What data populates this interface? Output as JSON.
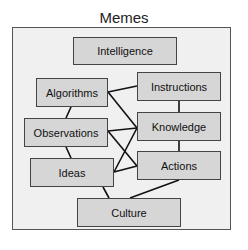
{
  "title": "Memes",
  "colors": {
    "frame_bg": "#f0f0f0",
    "node_bg": "#d6d6d6",
    "border": "#444444",
    "edge": "#111111"
  },
  "nodes": [
    {
      "id": "intelligence",
      "label": "Intelligence"
    },
    {
      "id": "algorithms",
      "label": "Algorithms"
    },
    {
      "id": "instructions",
      "label": "Instructions"
    },
    {
      "id": "observations",
      "label": "Observations"
    },
    {
      "id": "knowledge",
      "label": "Knowledge"
    },
    {
      "id": "ideas",
      "label": "Ideas"
    },
    {
      "id": "actions",
      "label": "Actions"
    },
    {
      "id": "culture",
      "label": "Culture"
    }
  ],
  "edges": [
    [
      "algorithms",
      "instructions"
    ],
    [
      "algorithms",
      "knowledge"
    ],
    [
      "algorithms",
      "observations"
    ],
    [
      "observations",
      "knowledge"
    ],
    [
      "observations",
      "actions"
    ],
    [
      "observations",
      "ideas"
    ],
    [
      "ideas",
      "knowledge"
    ],
    [
      "ideas",
      "actions"
    ],
    [
      "instructions",
      "knowledge"
    ],
    [
      "knowledge",
      "actions"
    ],
    [
      "ideas",
      "culture"
    ],
    [
      "actions",
      "culture"
    ]
  ]
}
